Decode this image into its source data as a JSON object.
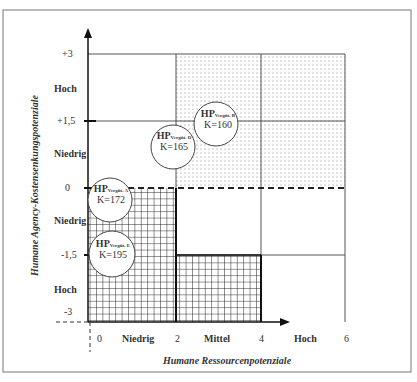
{
  "diagram": {
    "x_axis_title": "Humane Ressourcenpotenziale",
    "y_axis_title": "Humane Agency-Kostensenkungspotenziale",
    "x_ticks": [
      "0",
      "2",
      "4",
      "6"
    ],
    "x_categories": [
      "Niedrig",
      "Mittel",
      "Hoch"
    ],
    "y_ticks": [
      "+3",
      "+1,5",
      "0",
      "-1,5",
      "-3"
    ],
    "y_categories": [
      "Hoch",
      "Niedrig",
      "Niedrig",
      "Hoch"
    ],
    "points": [
      {
        "hp": "HP",
        "sub": "Vergüt. B",
        "k": "K=160"
      },
      {
        "hp": "HP",
        "sub": "Vergüt. D",
        "k": "K=165"
      },
      {
        "hp": "HP",
        "sub": "Vergüt. A",
        "k": "K=172"
      },
      {
        "hp": "HP",
        "sub": "Vergüt. E",
        "k": "K=195"
      }
    ]
  }
}
